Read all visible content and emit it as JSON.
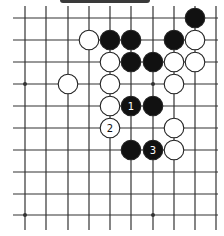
{
  "board": {
    "colors": {
      "black": "#111111",
      "white": "#ffffff",
      "line": "#333333",
      "background": "#ffffff"
    },
    "grid": {
      "x": [
        25,
        46,
        68,
        89,
        110,
        131,
        153,
        174,
        195,
        216
      ],
      "y": [
        18,
        40,
        62,
        84,
        106,
        128,
        150,
        172,
        194,
        215
      ],
      "line_x_start": 13,
      "line_x_end": 218,
      "line_y_start": 6,
      "line_y_end": 230
    },
    "star_points": [
      [
        0,
        3
      ],
      [
        6,
        3
      ],
      [
        0,
        9
      ],
      [
        6,
        9
      ]
    ],
    "stones": [
      {
        "color": "black",
        "col": 8,
        "row": 0,
        "label": ""
      },
      {
        "color": "white",
        "col": 3,
        "row": 1,
        "label": ""
      },
      {
        "color": "black",
        "col": 4,
        "row": 1,
        "label": ""
      },
      {
        "color": "black",
        "col": 5,
        "row": 1,
        "label": ""
      },
      {
        "color": "black",
        "col": 7,
        "row": 1,
        "label": ""
      },
      {
        "color": "white",
        "col": 8,
        "row": 1,
        "label": ""
      },
      {
        "color": "white",
        "col": 4,
        "row": 2,
        "label": ""
      },
      {
        "color": "black",
        "col": 5,
        "row": 2,
        "label": ""
      },
      {
        "color": "black",
        "col": 6,
        "row": 2,
        "label": ""
      },
      {
        "color": "white",
        "col": 7,
        "row": 2,
        "label": ""
      },
      {
        "color": "white",
        "col": 8,
        "row": 2,
        "label": ""
      },
      {
        "color": "white",
        "col": 2,
        "row": 3,
        "label": ""
      },
      {
        "color": "white",
        "col": 4,
        "row": 3,
        "label": ""
      },
      {
        "color": "white",
        "col": 7,
        "row": 3,
        "label": ""
      },
      {
        "color": "white",
        "col": 4,
        "row": 4,
        "label": ""
      },
      {
        "color": "black",
        "col": 5,
        "row": 4,
        "label": "1"
      },
      {
        "color": "black",
        "col": 6,
        "row": 4,
        "label": ""
      },
      {
        "color": "white",
        "col": 4,
        "row": 5,
        "label": "2"
      },
      {
        "color": "white",
        "col": 7,
        "row": 5,
        "label": ""
      },
      {
        "color": "black",
        "col": 5,
        "row": 6,
        "label": ""
      },
      {
        "color": "black",
        "col": 6,
        "row": 6,
        "label": "3"
      },
      {
        "color": "white",
        "col": 7,
        "row": 6,
        "label": ""
      }
    ]
  }
}
